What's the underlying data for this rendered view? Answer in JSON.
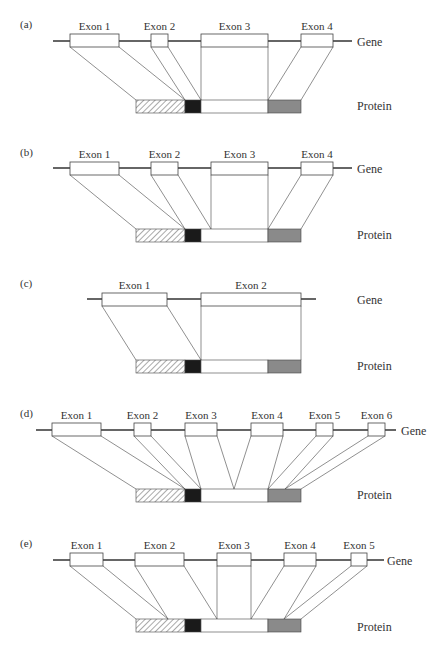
{
  "labels": {
    "gene": "Gene",
    "protein": "Protein"
  },
  "colors": {
    "line": "#333333",
    "stroke": "#444444",
    "hatch": "#555555",
    "black_domain": "#1a1a1a",
    "white_domain": "#ffffff",
    "gray_domain": "#8a8a8a"
  },
  "protein_domains": [
    "hatched",
    "black",
    "white",
    "gray"
  ],
  "panels": [
    {
      "id": "a",
      "label": "(a)",
      "gene_y": 41,
      "gene_x": [
        53,
        352
      ],
      "gene_label_x": 357,
      "gene_label_y": 46,
      "protein_y": 100,
      "protein_label_x": 357,
      "protein_label_y": 110,
      "exons": [
        {
          "name": "Exon 1",
          "x1": 70,
          "x2": 119,
          "top": 34,
          "p1": 136,
          "p2": 185
        },
        {
          "name": "Exon 2",
          "x1": 151,
          "x2": 168,
          "top": 34,
          "p1": 185,
          "p2": 201
        },
        {
          "name": "Exon 3",
          "x1": 201,
          "x2": 268,
          "top": 34,
          "p1": 201,
          "p2": 268
        },
        {
          "name": "Exon 4",
          "x1": 301,
          "x2": 333,
          "top": 34,
          "p1": 268,
          "p2": 301
        }
      ]
    },
    {
      "id": "b",
      "label": "(b)",
      "gene_y": 168,
      "gene_x": [
        53,
        352
      ],
      "gene_label_x": 357,
      "gene_label_y": 173,
      "protein_y": 229,
      "protein_label_x": 357,
      "protein_label_y": 239,
      "exons": [
        {
          "name": "Exon 1",
          "x1": 70,
          "x2": 119,
          "top": 162,
          "p1": 136,
          "p2": 185
        },
        {
          "name": "Exon 2",
          "x1": 151,
          "x2": 178,
          "top": 162,
          "p1": 185,
          "p2": 211
        },
        {
          "name": "Exon 3",
          "x1": 211,
          "x2": 268,
          "top": 162,
          "p1": 211,
          "p2": 268
        },
        {
          "name": "Exon 4",
          "x1": 301,
          "x2": 333,
          "top": 162,
          "p1": 268,
          "p2": 301
        }
      ]
    },
    {
      "id": "c",
      "label": "(c)",
      "gene_y": 299,
      "gene_x": [
        87,
        316
      ],
      "gene_label_x": 357,
      "gene_label_y": 304,
      "protein_y": 360,
      "protein_label_x": 357,
      "protein_label_y": 370,
      "exons": [
        {
          "name": "Exon 1",
          "x1": 102,
          "x2": 167,
          "top": 293,
          "p1": 136,
          "p2": 201
        },
        {
          "name": "Exon 2",
          "x1": 201,
          "x2": 301,
          "top": 293,
          "p1": 201,
          "p2": 301
        }
      ]
    },
    {
      "id": "d",
      "label": "(d)",
      "gene_y": 430,
      "gene_x": [
        36,
        396
      ],
      "gene_label_x": 401,
      "gene_label_y": 435,
      "protein_y": 489,
      "protein_label_x": 357,
      "protein_label_y": 499,
      "exons": [
        {
          "name": "Exon 1",
          "x1": 52,
          "x2": 101,
          "top": 423,
          "p1": 136,
          "p2": 185
        },
        {
          "name": "Exon 2",
          "x1": 134,
          "x2": 151,
          "top": 423,
          "p1": 185,
          "p2": 201
        },
        {
          "name": "Exon 3",
          "x1": 185,
          "x2": 217,
          "top": 423,
          "p1": 201,
          "p2": 234
        },
        {
          "name": "Exon 4",
          "x1": 251,
          "x2": 283,
          "top": 423,
          "p1": 234,
          "p2": 268
        },
        {
          "name": "Exon 5",
          "x1": 316,
          "x2": 333,
          "top": 423,
          "p1": 268,
          "p2": 285
        },
        {
          "name": "Exon 6",
          "x1": 368,
          "x2": 385,
          "top": 423,
          "p1": 285,
          "p2": 301
        }
      ]
    },
    {
      "id": "e",
      "label": "(e)",
      "gene_y": 560,
      "gene_x": [
        53,
        384
      ],
      "gene_label_x": 387,
      "gene_label_y": 565,
      "protein_y": 619,
      "protein_label_x": 357,
      "protein_label_y": 631,
      "exons": [
        {
          "name": "Exon 1",
          "x1": 70,
          "x2": 103,
          "top": 553,
          "p1": 136,
          "p2": 168
        },
        {
          "name": "Exon 2",
          "x1": 135,
          "x2": 184,
          "top": 553,
          "p1": 168,
          "p2": 217
        },
        {
          "name": "Exon 3",
          "x1": 217,
          "x2": 251,
          "top": 553,
          "p1": 217,
          "p2": 251
        },
        {
          "name": "Exon 4",
          "x1": 284,
          "x2": 316,
          "top": 553,
          "p1": 251,
          "p2": 284
        },
        {
          "name": "Exon 5",
          "x1": 351,
          "x2": 367,
          "top": 553,
          "p1": 284,
          "p2": 301
        }
      ]
    }
  ],
  "protein_segments": {
    "hatched": [
      136,
      185
    ],
    "black": [
      185,
      201
    ],
    "white": [
      201,
      268
    ],
    "gray": [
      268,
      301
    ]
  }
}
